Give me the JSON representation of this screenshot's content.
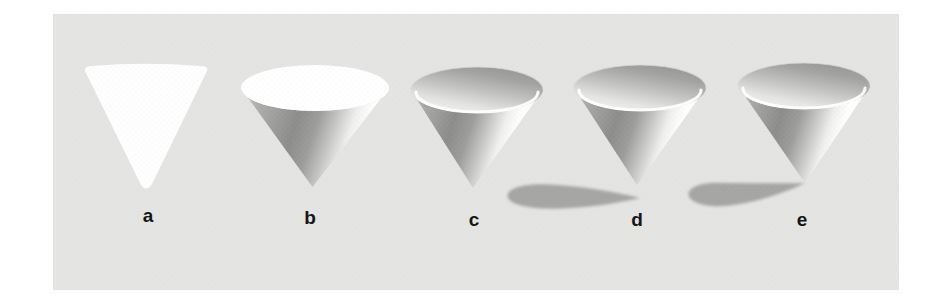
{
  "figure": {
    "labels": [
      {
        "label": "a"
      },
      {
        "label": "b"
      },
      {
        "label": "c"
      },
      {
        "label": "d"
      },
      {
        "label": "e"
      }
    ],
    "colors": {
      "page_background": "#ffffff",
      "panel_background": "#e4e4e2",
      "cone_face": "#fefefe",
      "cone_top_face": "#ffffff",
      "body_darkest": "#8c8c8a",
      "cast_shadow": "#a5a5a3",
      "label_text": "#161616"
    }
  }
}
